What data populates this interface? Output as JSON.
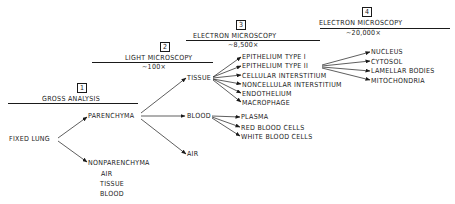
{
  "levels": [
    {
      "number": "1",
      "title": "GROSS ANALYSIS",
      "magnification": ""
    },
    {
      "number": "2",
      "title": "LIGHT MICROSCOPY",
      "magnification": "~100×"
    },
    {
      "number": "3",
      "title": "ELECTRON MICROSCOPY",
      "magnification": "~8,500×"
    },
    {
      "number": "4",
      "title": "ELECTRON MICROSCOPY",
      "magnification": "~20,000×"
    }
  ],
  "nodes": {
    "root": "FIXED LUNG",
    "parenchyma": "PARENCHYMA",
    "nonparenchyma": "NONPARENCHYMA",
    "nonparenchyma_items": [
      "AIR",
      "TISSUE",
      "BLOOD"
    ],
    "tissue": "TISSUE",
    "blood": "BLOOD",
    "air": "AIR",
    "tissue_items": [
      "EPITHELIUM TYPE I",
      "EPITHELIUM TYPE II",
      "CELLULAR INTERSTITIUM",
      "NONCELLULAR INTERSTITIUM",
      "ENDOTHELIUM",
      "MACROPHAGE"
    ],
    "blood_items": [
      "PLASMA",
      "RED BLOOD CELLS",
      "WHITE BLOOD CELLS"
    ],
    "type2_items": [
      "NUCLEUS",
      "CYTOSOL",
      "LAMELLAR BODIES",
      "MITOCHONDRIA"
    ]
  }
}
